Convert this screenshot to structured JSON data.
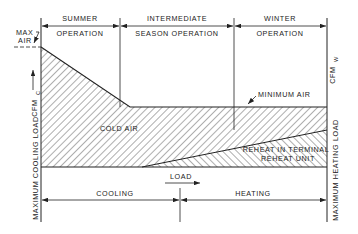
{
  "diagram": {
    "type": "air-volume-vs-load",
    "regions": {
      "summer": {
        "line1": "SUMMER",
        "line2": "OPERATION"
      },
      "intermediate": {
        "line1": "INTERMEDIATE",
        "line2": "SEASON OPERATION"
      },
      "winter": {
        "line1": "WINTER",
        "line2": "OPERATION"
      }
    },
    "labels": {
      "max_air_1": "MAX",
      "max_air_2": "AIR",
      "cfm_c": "CFM",
      "cfm_c_sub": "C",
      "cfm_w": "CFM",
      "cfm_w_sub": "W",
      "minimum_air": "MINIMUM AIR",
      "cold_air": "COLD AIR",
      "reheat_1": "REHEAT IN TERMINAL",
      "reheat_2": "REHEAT UNIT",
      "load": "LOAD",
      "cooling": "COOLING",
      "heating": "HEATING",
      "max_cooling_load": "MAXIMUM COOLING LOAD",
      "max_heating_load": "MAXIMUM HEATING LOAD"
    },
    "colors": {
      "line": "#222222",
      "background": "#ffffff"
    }
  }
}
